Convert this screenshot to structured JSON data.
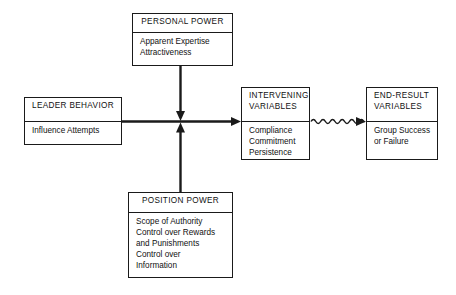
{
  "diagram": {
    "background_color": "#ffffff",
    "line_color": "#1a1a1a",
    "nodes": {
      "personal_power": {
        "title": "PERSONAL POWER",
        "body": "Apparent Expertise\nAttractiveness"
      },
      "leader_behavior": {
        "title": "LEADER BEHAVIOR",
        "body": "Influence Attempts"
      },
      "intervening_variables": {
        "title": "INTERVENING\nVARIABLES",
        "body": "Compliance\nCommitment\nPersistence"
      },
      "end_result_variables": {
        "title": "END-RESULT\nVARIABLES",
        "body": "Group Success\nor Failure"
      },
      "position_power": {
        "title": "POSITION POWER",
        "body": "Scope of Authority\nControl over Rewards\n   and Punishments\nControl over\n   Information"
      }
    },
    "connectors": [
      {
        "name": "personal-power-to-main",
        "from": "personal_power",
        "to": "main_flow",
        "style": "straight-arrow",
        "direction": "down"
      },
      {
        "name": "position-power-to-main",
        "from": "position_power",
        "to": "main_flow",
        "style": "straight-arrow",
        "direction": "up"
      },
      {
        "name": "leader-behavior-to-intervening-variables",
        "from": "leader_behavior",
        "to": "intervening_variables",
        "style": "straight-arrow",
        "direction": "right"
      },
      {
        "name": "intervening-to-end-result",
        "from": "intervening_variables",
        "to": "end_result_variables",
        "style": "wavy-arrow",
        "direction": "right"
      }
    ]
  }
}
